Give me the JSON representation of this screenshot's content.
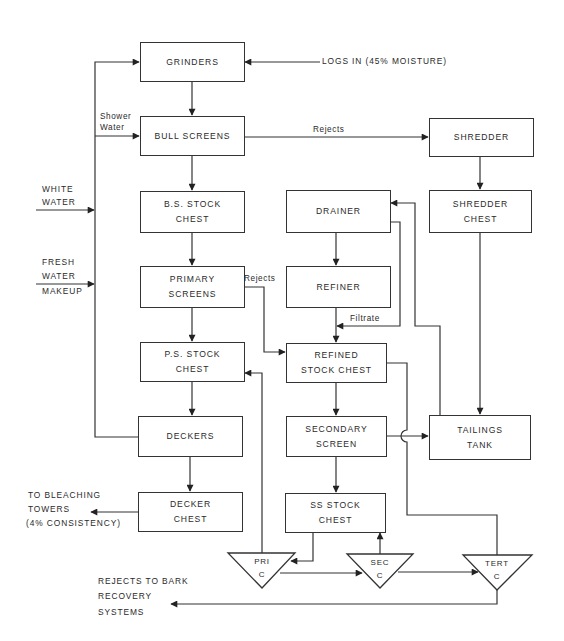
{
  "diagram": {
    "type": "process-flow",
    "boxes": {
      "grinders": {
        "line1": "GRINDERS",
        "line2": ""
      },
      "bull_screens": {
        "line1": "BULL SCREENS",
        "line2": ""
      },
      "shredder": {
        "line1": "SHREDDER",
        "line2": ""
      },
      "bs_stock_chest": {
        "line1": "B.S. STOCK",
        "line2": "CHEST"
      },
      "drainer": {
        "line1": "DRAINER",
        "line2": ""
      },
      "shredder_chest": {
        "line1": "SHREDDER",
        "line2": "CHEST"
      },
      "primary_screens": {
        "line1": "PRIMARY",
        "line2": "SCREENS"
      },
      "refiner": {
        "line1": "REFINER",
        "line2": ""
      },
      "ps_stock_chest": {
        "line1": "P.S. STOCK",
        "line2": "CHEST"
      },
      "refined_stock_chest": {
        "line1": "REFINED",
        "line2": "STOCK CHEST"
      },
      "deckers": {
        "line1": "DECKERS",
        "line2": ""
      },
      "secondary_screen": {
        "line1": "SECONDARY",
        "line2": "SCREEN"
      },
      "tailings_tank": {
        "line1": "TAILINGS",
        "line2": "TANK"
      },
      "decker_chest": {
        "line1": "DECKER",
        "line2": "CHEST"
      },
      "ss_stock_chest": {
        "line1": "SS STOCK",
        "line2": "CHEST"
      }
    },
    "cleaners": {
      "pri": {
        "line1": "PRI",
        "line2": "C"
      },
      "sec": {
        "line1": "SEC",
        "line2": "C"
      },
      "tert": {
        "line1": "TERT",
        "line2": "C"
      }
    },
    "labels": {
      "logs_in": "LOGS IN (45% MOISTURE)",
      "shower_water_1": "Shower",
      "shower_water_2": "Water",
      "rejects_bull": "Rejects",
      "white_water_1": "WHITE",
      "white_water_2": "WATER",
      "fresh_water_1": "FRESH",
      "fresh_water_2": "WATER",
      "fresh_water_3": "MAKEUP",
      "rejects_primary": "Rejects",
      "filtrate": "Filtrate",
      "bleaching_1": "TO BLEACHING",
      "bleaching_2": "TOWERS",
      "bleaching_3": "(4% CONSISTENCY)",
      "bark_1": "REJECTS TO BARK",
      "bark_2": "RECOVERY",
      "bark_3": "SYSTEMS"
    },
    "edges": [
      {
        "from": "LOGS IN",
        "to": "GRINDERS"
      },
      {
        "from": "GRINDERS",
        "to": "BULL SCREENS"
      },
      {
        "from": "Shower Water",
        "to": "BULL SCREENS"
      },
      {
        "from": "BULL SCREENS",
        "to": "SHREDDER",
        "label": "Rejects"
      },
      {
        "from": "BULL SCREENS",
        "to": "B.S. STOCK CHEST"
      },
      {
        "from": "SHREDDER",
        "to": "SHREDDER CHEST"
      },
      {
        "from": "SHREDDER CHEST",
        "to": "TAILINGS TANK"
      },
      {
        "from": "TAILINGS TANK",
        "to": "DRAINER"
      },
      {
        "from": "DRAINER",
        "to": "REFINER"
      },
      {
        "from": "DRAINER",
        "to": "REFINED STOCK CHEST",
        "label": "Filtrate"
      },
      {
        "from": "REFINER",
        "to": "REFINED STOCK CHEST"
      },
      {
        "from": "B.S. STOCK CHEST",
        "to": "PRIMARY SCREENS"
      },
      {
        "from": "PRIMARY SCREENS",
        "to": "REFINED STOCK CHEST",
        "label": "Rejects"
      },
      {
        "from": "PRIMARY SCREENS",
        "to": "P.S. STOCK CHEST"
      },
      {
        "from": "P.S. STOCK CHEST",
        "to": "DECKERS"
      },
      {
        "from": "DECKERS",
        "to": "GRINDERS (white water loop)"
      },
      {
        "from": "WHITE WATER",
        "to": "loop"
      },
      {
        "from": "FRESH WATER MAKEUP",
        "to": "loop"
      },
      {
        "from": "DECKERS",
        "to": "DECKER CHEST"
      },
      {
        "from": "DECKER CHEST",
        "to": "TO BLEACHING TOWERS (4% CONSISTENCY)"
      },
      {
        "from": "REFINED STOCK CHEST",
        "to": "SECONDARY SCREEN"
      },
      {
        "from": "REFINED STOCK CHEST",
        "to": "TERT C"
      },
      {
        "from": "SECONDARY SCREEN",
        "to": "TAILINGS TANK"
      },
      {
        "from": "SECONDARY SCREEN",
        "to": "SS STOCK CHEST"
      },
      {
        "from": "SS STOCK CHEST",
        "to": "PRI C"
      },
      {
        "from": "PRI C",
        "to": "P.S. STOCK CHEST"
      },
      {
        "from": "PRI C",
        "to": "SEC C"
      },
      {
        "from": "SEC C",
        "to": "SS STOCK CHEST"
      },
      {
        "from": "SEC C",
        "to": "TERT C"
      },
      {
        "from": "TERT C",
        "to": "REJECTS TO BARK RECOVERY SYSTEMS"
      }
    ]
  }
}
